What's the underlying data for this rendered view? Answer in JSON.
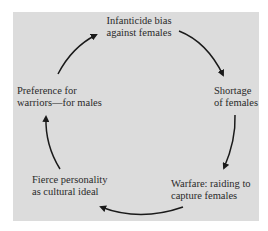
{
  "diagram": {
    "type": "cycle",
    "background_color": "#dcdcdc",
    "nodes": [
      {
        "id": "infanticide",
        "lines": [
          "Infanticide bias",
          "against females"
        ]
      },
      {
        "id": "shortage",
        "lines": [
          "Shortage",
          "of females"
        ]
      },
      {
        "id": "warfare",
        "lines": [
          "Warfare:  raiding to",
          "capture females"
        ]
      },
      {
        "id": "fierce",
        "lines": [
          "Fierce personality",
          "as cultural ideal"
        ]
      },
      {
        "id": "preference",
        "lines": [
          "Preference for",
          "warriors—for males"
        ]
      }
    ],
    "edges": [
      {
        "from": "infanticide",
        "to": "shortage"
      },
      {
        "from": "shortage",
        "to": "warfare"
      },
      {
        "from": "warfare",
        "to": "fierce"
      },
      {
        "from": "fierce",
        "to": "preference"
      },
      {
        "from": "preference",
        "to": "infanticide"
      }
    ]
  }
}
